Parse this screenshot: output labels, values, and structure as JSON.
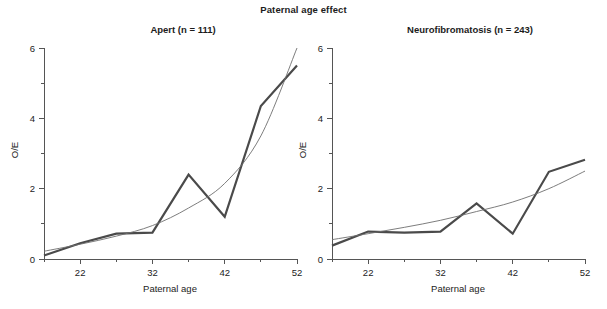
{
  "figure": {
    "title": "Paternal age effect",
    "background_color": "#ffffff",
    "text_color": "#1c1c1c",
    "axis_color": "#555555",
    "observed_color": "#4a4a4a",
    "fitted_color": "#6e6e6e"
  },
  "chart_data": [
    {
      "type": "line",
      "id": "apert",
      "title": "Apert (n = 111)",
      "xlabel": "Paternal age",
      "ylabel": "O/E",
      "xlim": [
        17,
        52
      ],
      "ylim": [
        0,
        6
      ],
      "xticks_major": [
        22,
        32,
        42,
        52
      ],
      "xticks_major_labels": [
        "22",
        "32",
        "42",
        "52"
      ],
      "xticks_minor": [
        17,
        27,
        37,
        47
      ],
      "yticks_major": [
        0,
        2,
        4,
        6
      ],
      "yticks_major_labels": [
        "0",
        "2",
        "4",
        "6"
      ],
      "yticks_minor": [
        1,
        3,
        5
      ],
      "grid": false,
      "legend": "none",
      "series": [
        {
          "name": "Observed O/E",
          "style": "thick-polyline",
          "color": "#4a4a4a",
          "x": [
            17,
            22,
            27,
            32,
            37,
            42,
            47,
            52
          ],
          "values": [
            0.1,
            0.45,
            0.72,
            0.75,
            2.4,
            1.2,
            4.35,
            5.5
          ]
        },
        {
          "name": "Fitted curve",
          "style": "thin-smooth",
          "color": "#6e6e6e",
          "x": [
            17,
            22,
            27,
            32,
            37,
            42,
            47,
            52
          ],
          "values": [
            0.22,
            0.42,
            0.65,
            0.95,
            1.45,
            2.15,
            3.5,
            6.0
          ]
        }
      ]
    },
    {
      "type": "line",
      "id": "neurofibromatosis",
      "title": "Neurofibromatosis (n = 243)",
      "xlabel": "Paternal age",
      "ylabel": "O/E",
      "xlim": [
        17,
        52
      ],
      "ylim": [
        0,
        6
      ],
      "xticks_major": [
        22,
        32,
        42,
        52
      ],
      "xticks_major_labels": [
        "22",
        "32",
        "42",
        "52"
      ],
      "xticks_minor": [
        17,
        27,
        37,
        47
      ],
      "yticks_major": [
        0,
        2,
        4,
        6
      ],
      "yticks_major_labels": [
        "0",
        "2",
        "4",
        "6"
      ],
      "yticks_minor": [
        1,
        3,
        5
      ],
      "grid": false,
      "legend": "none",
      "series": [
        {
          "name": "Observed O/E",
          "style": "thick-polyline",
          "color": "#4a4a4a",
          "x": [
            17,
            22,
            27,
            32,
            37,
            42,
            47,
            52
          ],
          "values": [
            0.38,
            0.78,
            0.75,
            0.78,
            1.58,
            0.72,
            2.48,
            2.82
          ]
        },
        {
          "name": "Fitted curve",
          "style": "thin-smooth",
          "color": "#6e6e6e",
          "x": [
            17,
            22,
            27,
            32,
            37,
            42,
            47,
            52
          ],
          "values": [
            0.55,
            0.72,
            0.9,
            1.1,
            1.35,
            1.62,
            2.0,
            2.5
          ]
        }
      ]
    }
  ]
}
